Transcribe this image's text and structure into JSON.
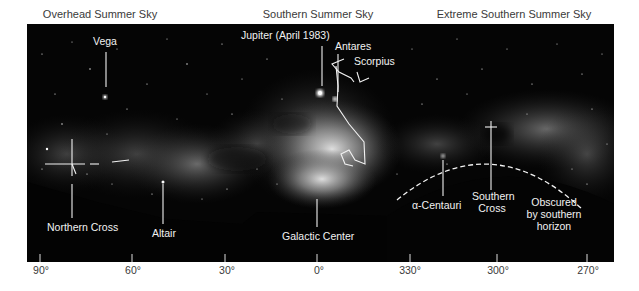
{
  "sections": [
    {
      "title": "Overhead Summer Sky",
      "x": 100
    },
    {
      "title": "Southern Summer Sky",
      "x": 318
    },
    {
      "title": "Extreme Southern Summer Sky",
      "x": 512
    }
  ],
  "labels": {
    "vega": "Vega",
    "jupiter": "Jupiter (April 1983)",
    "antares": "Antares",
    "scorpius": "Scorpius",
    "northern_cross": "Northern Cross",
    "altair": "Altair",
    "galactic_center": "Galactic Center",
    "alpha_centauri": "α-Centauri",
    "southern_cross_1": "Southern",
    "southern_cross_2": "Cross",
    "obscured_1": "Obscured",
    "obscured_2": "by southern",
    "obscured_3": "horizon"
  },
  "axis": {
    "ticks": [
      {
        "label": "90°",
        "x": 40
      },
      {
        "label": "60°",
        "x": 132
      },
      {
        "label": "30°",
        "x": 225
      },
      {
        "label": "0°",
        "x": 317
      },
      {
        "label": "330°",
        "x": 410
      },
      {
        "label": "300°",
        "x": 497
      },
      {
        "label": "270°",
        "x": 587
      }
    ]
  },
  "colors": {
    "sky": "#050505",
    "annotation": "#f2f2f2",
    "title_text": "#3a3a3a"
  }
}
